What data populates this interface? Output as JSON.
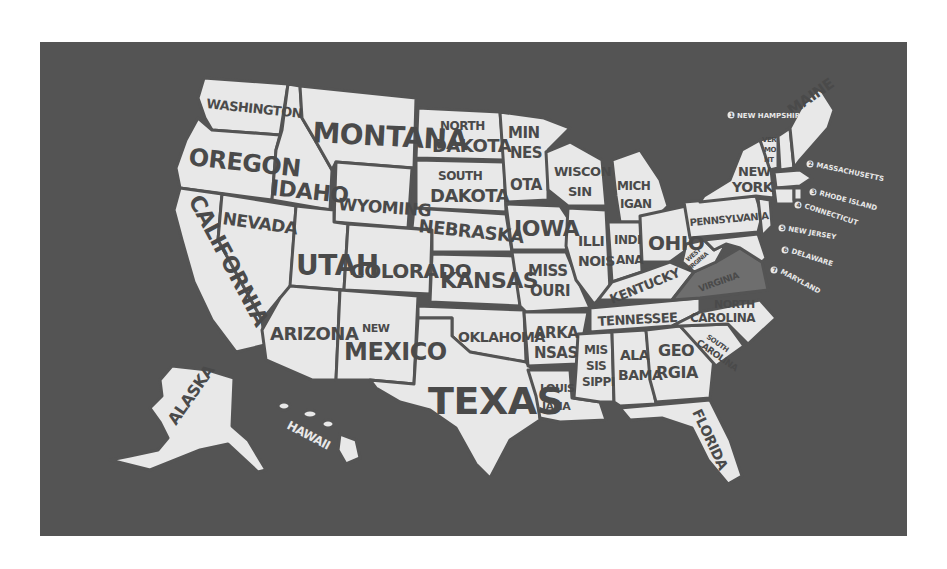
{
  "map": {
    "title": "United States map",
    "colors": {
      "background": "#ffffff",
      "panel": "#545454",
      "state_fill": "#e8e8e8",
      "label": "#4a4a4a",
      "highlight": "#6e6e6e"
    },
    "highlighted_state": "Virginia",
    "states": {
      "washington": "WASHINGTON",
      "oregon": "OREGON",
      "california": "CALIFORNIA",
      "idaho": "IDAHO",
      "nevada": "NEVADA",
      "montana": "MONTANA",
      "wyoming": "WYOMING",
      "utah": "UTAH",
      "arizona": "ARIZONA",
      "colorado": "COLORADO",
      "new_mexico_1": "NEW",
      "new_mexico_2": "MEXICO",
      "north_dakota_1": "NORTH",
      "north_dakota_2": "DAKOTA",
      "south_dakota_1": "SOUTH",
      "south_dakota_2": "DAKOTA",
      "nebraska": "NEBRASKA",
      "kansas": "KANSAS",
      "oklahoma": "OKLAHOMA",
      "texas": "TEXAS",
      "minnesota_1": "MIN",
      "minnesota_2": "NES",
      "minnesota_3": "OTA",
      "iowa": "IOWA",
      "missouri_1": "MISS",
      "missouri_2": "OURI",
      "arkansas_1": "ARKA",
      "arkansas_2": "NSAS",
      "louisiana_1": "LOUIS",
      "louisiana_2": "IANA",
      "wisconsin_1": "WISCON",
      "wisconsin_2": "SIN",
      "illinois_1": "ILLI",
      "illinois_2": "NOIS",
      "michigan_1": "MICH",
      "michigan_2": "IGAN",
      "indiana_1": "INDI",
      "indiana_2": "ANA",
      "ohio": "OHIO",
      "kentucky": "KENTUCKY",
      "tennessee": "TENNESSEE",
      "mississippi_1": "MIS",
      "mississippi_2": "SIS",
      "mississippi_3": "SIPPI",
      "alabama_1": "ALA",
      "alabama_2": "BAMA",
      "georgia_1": "GEO",
      "georgia_2": "RGIA",
      "florida": "FLORIDA",
      "south_carolina_1": "SOUTH",
      "south_carolina_2": "CAROLINA",
      "north_carolina_1": "NORTH",
      "north_carolina_2": "CAROLINA",
      "virginia": "VIRGINIA",
      "west_virginia_1": "WEST",
      "west_virginia_2": "VIRGINIA",
      "pennsylvania": "PENNSYLVANIA",
      "new_york_1": "NEW",
      "new_york_2": "YORK",
      "vermont_1": "VER",
      "vermont_2": "MO",
      "vermont_3": "NT",
      "maine": "MAINE",
      "alaska": "ALASKA",
      "hawaii": "HAWAII"
    },
    "callouts": [
      {
        "num": "1",
        "label": "NEW HAMPSHIRE"
      },
      {
        "num": "2",
        "label": "MASSACHUSETTS"
      },
      {
        "num": "3",
        "label": "RHODE ISLAND"
      },
      {
        "num": "4",
        "label": "CONNECTICUT"
      },
      {
        "num": "5",
        "label": "NEW JERSEY"
      },
      {
        "num": "6",
        "label": "DELAWARE"
      },
      {
        "num": "7",
        "label": "MARYLAND"
      }
    ]
  }
}
